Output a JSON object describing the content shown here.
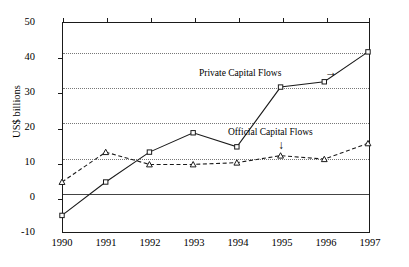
{
  "chart_data": {
    "type": "line",
    "title": "",
    "xlabel": "",
    "ylabel": "US$ billions",
    "x": [
      1990,
      1991,
      1992,
      1993,
      1994,
      1995,
      1996,
      1997
    ],
    "categories": [
      "1990",
      "1991",
      "1992",
      "1993",
      "1994",
      "1995",
      "1996",
      "1997"
    ],
    "series": [
      {
        "name": "Private Capital Flows",
        "values": [
          -5,
          4.5,
          13,
          18.5,
          14.5,
          31.5,
          33,
          41.5
        ],
        "linestyle": "solid",
        "marker": "square",
        "color": "#1a1a1a"
      },
      {
        "name": "Official Capital Flows",
        "values": [
          4.5,
          13,
          9.5,
          9.5,
          10,
          12,
          11,
          15.5
        ],
        "linestyle": "dashed",
        "marker": "triangle",
        "color": "#1a1a1a"
      }
    ],
    "ylim": [
      -10,
      50
    ],
    "xlim": [
      1990,
      1997
    ],
    "yticks": [
      -10,
      0,
      10,
      20,
      30,
      40,
      50
    ],
    "ytick_labels": [
      "-10",
      "0",
      "10",
      "20",
      "30",
      "40",
      "50"
    ],
    "gridlines_y": [
      10,
      20,
      30,
      40
    ],
    "zero_line": 0,
    "grid": true,
    "legend_position": "inline-annotations",
    "annotations": [
      {
        "text": "Private Capital Flows",
        "arrow": "→",
        "arrow_direction": "right",
        "target_series": "Private Capital Flows"
      },
      {
        "text": "Official Capital Flows",
        "arrow": "↓",
        "arrow_direction": "down",
        "target_series": "Official Capital Flows"
      }
    ]
  }
}
